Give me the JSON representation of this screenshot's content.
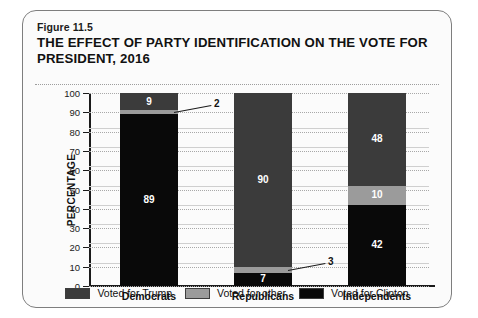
{
  "figure": {
    "number": "Figure 11.5",
    "title": "THE EFFECT OF PARTY IDENTIFICATION ON THE VOTE FOR PRESIDENT, 2016"
  },
  "chart_data": {
    "type": "bar",
    "subtype": "stacked-vertical-100pct",
    "title": "THE EFFECT OF PARTY IDENTIFICATION ON THE VOTE FOR PRESIDENT, 2016",
    "xlabel": "",
    "ylabel": "PERCENTAGE",
    "ylim": [
      0,
      100
    ],
    "yticks": [
      0,
      10,
      20,
      30,
      40,
      50,
      60,
      70,
      80,
      90,
      100
    ],
    "grid": true,
    "legend_position": "bottom",
    "categories": [
      "Democrats",
      "Republicans",
      "Independents"
    ],
    "series": [
      {
        "name": "Voted for Clinton",
        "color": "#090909",
        "values": [
          89,
          7,
          42
        ]
      },
      {
        "name": "Voted for other",
        "color": "#9b9b9b",
        "values": [
          2,
          3,
          10
        ]
      },
      {
        "name": "Voted for Trump",
        "color": "#3b3b3b",
        "values": [
          9,
          90,
          48
        ]
      }
    ],
    "stack_order_bottom_to_top": [
      "Voted for Clinton",
      "Voted for other",
      "Voted for Trump"
    ],
    "annotations": [
      {
        "text": "2",
        "category": "Democrats",
        "series": "Voted for other",
        "value": 2,
        "style": "external-leader"
      },
      {
        "text": "3",
        "category": "Republicans",
        "series": "Voted for other",
        "value": 3,
        "style": "external-leader"
      }
    ],
    "data_labels": {
      "Democrats": {
        "Voted for Clinton": "89",
        "Voted for other": "2",
        "Voted for Trump": "9"
      },
      "Republicans": {
        "Voted for Clinton": "7",
        "Voted for other": "3",
        "Voted for Trump": "90"
      },
      "Independents": {
        "Voted for Clinton": "42",
        "Voted for other": "10",
        "Voted for Trump": "48"
      }
    }
  },
  "axis": {
    "y_label": "PERCENTAGE",
    "y_ticks": [
      "100",
      "90",
      "80",
      "70",
      "60",
      "50",
      "40",
      "30",
      "20",
      "10",
      "0"
    ]
  },
  "legend": {
    "items": [
      {
        "label": "Voted for Trump",
        "color": "#3b3b3b"
      },
      {
        "label": "Voted for other",
        "color": "#9b9b9b"
      },
      {
        "label": "Voted for Clinton",
        "color": "#090909"
      }
    ]
  }
}
